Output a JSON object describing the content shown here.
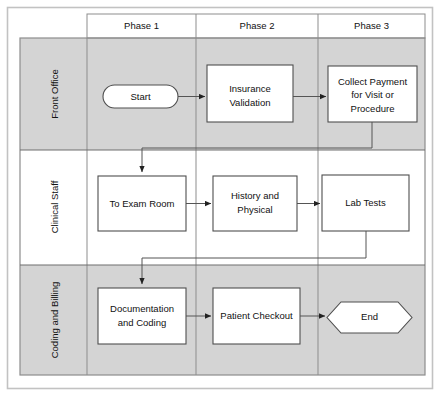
{
  "diagram": {
    "type": "swimlane-flowchart",
    "outer_border_color": "#b9b9b9",
    "grid_line_color": "#8d8d8d",
    "shaded_lane_color": "#d4d4d4",
    "plain_lane_color": "#ffffff",
    "node_fill": "#ffffff",
    "node_stroke": "#555555",
    "connector_color": "#555555",
    "phases": [
      {
        "id": "phase1",
        "label": "Phase 1"
      },
      {
        "id": "phase2",
        "label": "Phase 2"
      },
      {
        "id": "phase3",
        "label": "Phase 3"
      }
    ],
    "lanes": [
      {
        "id": "front-office",
        "label": "Front Office",
        "shaded": true
      },
      {
        "id": "clinical-staff",
        "label": "Clinical Staff",
        "shaded": false
      },
      {
        "id": "coding-and-billing",
        "label": "Coding and Billing",
        "shaded": true
      }
    ],
    "nodes": [
      {
        "id": "start",
        "shape": "stadium",
        "lane": "front-office",
        "phase": "phase1",
        "label": "Start",
        "lines": [
          "Start"
        ]
      },
      {
        "id": "insurance-validation",
        "shape": "rect",
        "lane": "front-office",
        "phase": "phase2",
        "label": "Insurance Validation",
        "lines": [
          "Insurance",
          "Validation"
        ]
      },
      {
        "id": "collect-payment",
        "shape": "rect",
        "lane": "front-office",
        "phase": "phase3",
        "label": "Collect Payment for Visit or Procedure",
        "lines": [
          "Collect Payment",
          "for Visit or",
          "Procedure"
        ]
      },
      {
        "id": "to-exam-room",
        "shape": "rect",
        "lane": "clinical-staff",
        "phase": "phase1",
        "label": "To Exam Room",
        "lines": [
          "To Exam Room"
        ]
      },
      {
        "id": "history-and-physical",
        "shape": "rect",
        "lane": "clinical-staff",
        "phase": "phase2",
        "label": "History and Physical",
        "lines": [
          "History and",
          "Physical"
        ]
      },
      {
        "id": "lab-tests",
        "shape": "rect",
        "lane": "clinical-staff",
        "phase": "phase3",
        "label": "Lab Tests",
        "lines": [
          "Lab Tests"
        ]
      },
      {
        "id": "documentation-and-coding",
        "shape": "rect",
        "lane": "coding-and-billing",
        "phase": "phase1",
        "label": "Documentation and Coding",
        "lines": [
          "Documentation",
          "and Coding"
        ]
      },
      {
        "id": "patient-checkout",
        "shape": "rect",
        "lane": "coding-and-billing",
        "phase": "phase2",
        "label": "Patient Checkout",
        "lines": [
          "Patient Checkout"
        ]
      },
      {
        "id": "end",
        "shape": "hexagon",
        "lane": "coding-and-billing",
        "phase": "phase3",
        "label": "End",
        "lines": [
          "End"
        ]
      }
    ],
    "connectors": [
      {
        "id": "start-to-insurance",
        "from": "start",
        "to": "insurance-validation",
        "routing": "straight"
      },
      {
        "id": "insurance-to-collect",
        "from": "insurance-validation",
        "to": "collect-payment",
        "routing": "straight"
      },
      {
        "id": "collect-to-exam",
        "from": "collect-payment",
        "to": "to-exam-room",
        "routing": "elbow-down-left"
      },
      {
        "id": "exam-to-history",
        "from": "to-exam-room",
        "to": "history-and-physical",
        "routing": "straight"
      },
      {
        "id": "history-to-lab",
        "from": "history-and-physical",
        "to": "lab-tests",
        "routing": "straight"
      },
      {
        "id": "lab-to-documentation",
        "from": "lab-tests",
        "to": "documentation-and-coding",
        "routing": "elbow-down-left"
      },
      {
        "id": "documentation-to-checkout",
        "from": "documentation-and-coding",
        "to": "patient-checkout",
        "routing": "straight"
      },
      {
        "id": "checkout-to-end",
        "from": "patient-checkout",
        "to": "end",
        "routing": "straight"
      }
    ]
  }
}
